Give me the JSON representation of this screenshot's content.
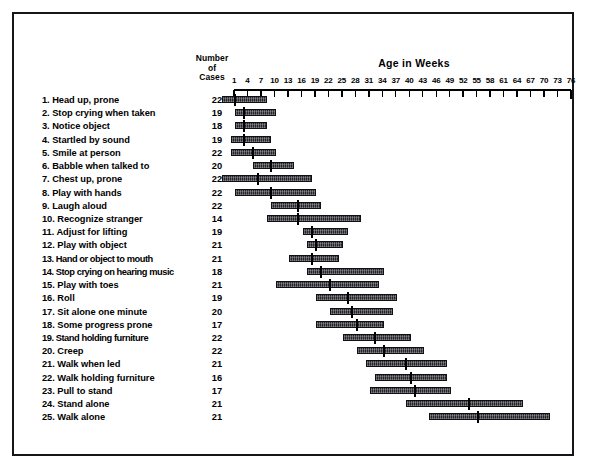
{
  "header": {
    "cases_label": "Number\nof\nCases",
    "cases_line1": "Number",
    "cases_line2": "of",
    "cases_line3": "Cases",
    "age_title": "Age in Weeks"
  },
  "chart_data": {
    "type": "bar",
    "title": "Age in Weeks",
    "xlabel": "Age in Weeks",
    "ylabel": "",
    "xlim": [
      1,
      76
    ],
    "grid": false,
    "legend": null,
    "tick_labels": [
      1,
      4,
      7,
      10,
      13,
      16,
      19,
      22,
      25,
      28,
      31,
      34,
      37,
      40,
      43,
      46,
      49,
      52,
      55,
      58,
      61,
      64,
      67,
      70,
      73,
      76
    ],
    "value_columns": [
      "Number of Cases"
    ],
    "categories": [
      "1. Head up, prone",
      "2. Stop crying when taken",
      "3. Notice object",
      "4. Startled by sound",
      "5. Smile at person",
      "6. Babble when talked to",
      "7. Chest up, prone",
      "8. Play with hands",
      "9. Laugh aloud",
      "10. Recognize stranger",
      "11. Adjust for lifting",
      "12. Play with object",
      "13. Hand or object to mouth",
      "14. Stop crying on hearing music",
      "15. Play with toes",
      "16. Roll",
      "17. Sit alone one minute",
      "18. Some progress prone",
      "19. Stand holding furniture",
      "20. Creep",
      "21. Walk when led",
      "22. Walk holding furniture",
      "23. Pull to stand",
      "24. Stand alone",
      "25. Walk alone"
    ],
    "rows": [
      {
        "n": 1,
        "label": "1. Head up, prone",
        "cases": 22,
        "start": 1,
        "median": 4,
        "end": 11
      },
      {
        "n": 2,
        "label": "2. Stop crying when taken",
        "cases": 19,
        "start": 4,
        "median": 6,
        "end": 13
      },
      {
        "n": 3,
        "label": "3. Notice object",
        "cases": 18,
        "start": 4,
        "median": 6,
        "end": 11
      },
      {
        "n": 4,
        "label": "4. Startled by sound",
        "cases": 19,
        "start": 3,
        "median": 6,
        "end": 12
      },
      {
        "n": 5,
        "label": "5. Smile at person",
        "cases": 22,
        "start": 3,
        "median": 8,
        "end": 13
      },
      {
        "n": 6,
        "label": "6. Babble when talked to",
        "cases": 20,
        "start": 8,
        "median": 12,
        "end": 17
      },
      {
        "n": 7,
        "label": "7. Chest up, prone",
        "cases": 22,
        "start": 1,
        "median": 9,
        "end": 21
      },
      {
        "n": 8,
        "label": "8. Play with hands",
        "cases": 22,
        "start": 4,
        "median": 12,
        "end": 22
      },
      {
        "n": 9,
        "label": "9. Laugh aloud",
        "cases": 22,
        "start": 12,
        "median": 18,
        "end": 23
      },
      {
        "n": 10,
        "label": "10. Recognize stranger",
        "cases": 14,
        "start": 11,
        "median": 18,
        "end": 32
      },
      {
        "n": 11,
        "label": "11. Adjust for lifting",
        "cases": 19,
        "start": 19,
        "median": 21,
        "end": 29
      },
      {
        "n": 12,
        "label": "12. Play with object",
        "cases": 21,
        "start": 20,
        "median": 22,
        "end": 28
      },
      {
        "n": 13,
        "label": "13. Hand or object to mouth",
        "cases": 21,
        "start": 16,
        "median": 21,
        "end": 27
      },
      {
        "n": 14,
        "label": "14. Stop crying on hearing music",
        "cases": 18,
        "start": 20,
        "median": 23,
        "end": 37
      },
      {
        "n": 15,
        "label": "15. Play with toes",
        "cases": 21,
        "start": 13,
        "median": 25,
        "end": 36
      },
      {
        "n": 16,
        "label": "16. Roll",
        "cases": 19,
        "start": 22,
        "median": 29,
        "end": 40
      },
      {
        "n": 17,
        "label": "17. Sit alone one minute",
        "cases": 20,
        "start": 25,
        "median": 30,
        "end": 39
      },
      {
        "n": 18,
        "label": "18. Some progress prone",
        "cases": 17,
        "start": 22,
        "median": 31,
        "end": 37
      },
      {
        "n": 19,
        "label": "19. Stand holding furniture",
        "cases": 22,
        "start": 28,
        "median": 35,
        "end": 43
      },
      {
        "n": 20,
        "label": "20. Creep",
        "cases": 22,
        "start": 31,
        "median": 37,
        "end": 46
      },
      {
        "n": 21,
        "label": "21. Walk when led",
        "cases": 21,
        "start": 33,
        "median": 42,
        "end": 51
      },
      {
        "n": 22,
        "label": "22. Walk holding furniture",
        "cases": 16,
        "start": 35,
        "median": 43,
        "end": 51
      },
      {
        "n": 23,
        "label": "23. Pull to stand",
        "cases": 17,
        "start": 34,
        "median": 44,
        "end": 52
      },
      {
        "n": 24,
        "label": "24. Stand alone",
        "cases": 21,
        "start": 42,
        "median": 56,
        "end": 68
      },
      {
        "n": 25,
        "label": "25. Walk alone",
        "cases": 21,
        "start": 47,
        "median": 58,
        "end": 74
      }
    ]
  }
}
